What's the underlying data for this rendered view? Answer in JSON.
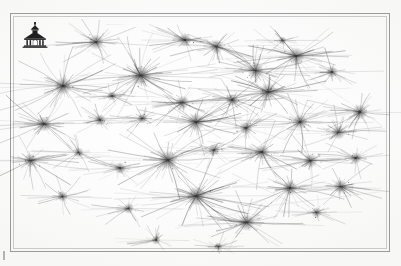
{
  "document": {
    "kind": "scanned-plate",
    "page_background": "#fdfdfd",
    "frame_color": "#9a9a9a",
    "ink_color": "#3a3a3a",
    "label_color": "#767676",
    "frame": {
      "x": 10,
      "y": 13,
      "width": 380,
      "height": 239
    }
  },
  "emblem": {
    "name": "institutional-building-emblem",
    "x": 21,
    "y": 22,
    "width": 28,
    "height": 26,
    "color": "#1f1f1f",
    "caption": ""
  },
  "registration_tick": {
    "x": 3,
    "y": 251,
    "width": 2,
    "height": 9,
    "color": "#b3b3b3"
  },
  "rule_lines": [
    {
      "x": 120,
      "y": 188,
      "length": 150,
      "angle": 11,
      "opacity": 0.55
    },
    {
      "x": 150,
      "y": 200,
      "length": 120,
      "angle": -9,
      "opacity": 0.4
    },
    {
      "x": 232,
      "y": 173,
      "length": 95,
      "angle": 26,
      "opacity": 0.45
    },
    {
      "x": 270,
      "y": 205,
      "length": 110,
      "angle": -7,
      "opacity": 0.4
    },
    {
      "x": 40,
      "y": 150,
      "length": 70,
      "angle": 4,
      "opacity": 0.3
    },
    {
      "x": 300,
      "y": 70,
      "length": 60,
      "angle": 33,
      "opacity": 0.35
    },
    {
      "x": 175,
      "y": 228,
      "length": 80,
      "angle": -14,
      "opacity": 0.35
    }
  ],
  "clusters": [
    {
      "x": 96,
      "y": 42,
      "size": 26,
      "density": 34,
      "reach": 1.15,
      "weight": 0.6,
      "label": "——— –– –– ––",
      "label_dx": 10,
      "label_dy": -18,
      "label_size": 2.4,
      "label_angle": 0
    },
    {
      "x": 63,
      "y": 86,
      "size": 30,
      "density": 42,
      "reach": 1.55,
      "weight": 0.72,
      "label": "–– –– –",
      "label_dx": 13,
      "label_dy": 2,
      "label_size": 2.3,
      "label_angle": 0
    },
    {
      "x": 140,
      "y": 75,
      "size": 34,
      "density": 52,
      "reach": 1.45,
      "weight": 0.85,
      "label": "—— –– ––",
      "label_dx": 15,
      "label_dy": 1,
      "label_size": 2.4,
      "label_angle": 0
    },
    {
      "x": 185,
      "y": 40,
      "size": 22,
      "density": 28,
      "reach": 1.25,
      "weight": 0.5,
      "label": "",
      "label_dx": 0,
      "label_dy": 0,
      "label_size": 2.2,
      "label_angle": 0
    },
    {
      "x": 216,
      "y": 46,
      "size": 24,
      "density": 30,
      "reach": 1.2,
      "weight": 0.55,
      "label": "",
      "label_dx": 0,
      "label_dy": 0,
      "label_size": 2.2,
      "label_angle": 0
    },
    {
      "x": 255,
      "y": 70,
      "size": 28,
      "density": 38,
      "reach": 1.35,
      "weight": 0.66,
      "label": "–– ––– –",
      "label_dx": 12,
      "label_dy": 0,
      "label_size": 2.3,
      "label_angle": 0
    },
    {
      "x": 296,
      "y": 56,
      "size": 30,
      "density": 40,
      "reach": 1.3,
      "weight": 0.7,
      "label": "———— –––",
      "label_dx": -6,
      "label_dy": -11,
      "label_size": 2.4,
      "label_angle": 0
    },
    {
      "x": 332,
      "y": 72,
      "size": 20,
      "density": 24,
      "reach": 1.4,
      "weight": 0.45,
      "label": "",
      "label_dx": 0,
      "label_dy": 0,
      "label_size": 2.2,
      "label_angle": 0
    },
    {
      "x": 360,
      "y": 112,
      "size": 26,
      "density": 34,
      "reach": 1.3,
      "weight": 0.6,
      "label": "–– ––",
      "label_dx": -24,
      "label_dy": 0,
      "label_size": 2.3,
      "label_angle": 0
    },
    {
      "x": 182,
      "y": 102,
      "size": 24,
      "density": 30,
      "reach": 1.25,
      "weight": 0.56,
      "label": "—— –– –",
      "label_dx": -26,
      "label_dy": -6,
      "label_size": 2.3,
      "label_angle": 0
    },
    {
      "x": 232,
      "y": 100,
      "size": 22,
      "density": 26,
      "reach": 1.35,
      "weight": 0.5,
      "label": "––– ––",
      "label_dx": 11,
      "label_dy": 1,
      "label_size": 2.3,
      "label_angle": 0
    },
    {
      "x": 268,
      "y": 92,
      "size": 30,
      "density": 44,
      "reach": 1.3,
      "weight": 0.74,
      "label": "",
      "label_dx": 0,
      "label_dy": 0,
      "label_size": 2.2,
      "label_angle": 0
    },
    {
      "x": 44,
      "y": 124,
      "size": 26,
      "density": 36,
      "reach": 1.45,
      "weight": 0.62,
      "label": "–– –",
      "label_dx": 13,
      "label_dy": 1,
      "label_size": 2.3,
      "label_angle": 0
    },
    {
      "x": 100,
      "y": 120,
      "size": 20,
      "density": 22,
      "reach": 1.2,
      "weight": 0.44,
      "label": "–––",
      "label_dx": 9,
      "label_dy": 2,
      "label_size": 2.2,
      "label_angle": 0
    },
    {
      "x": 142,
      "y": 118,
      "size": 18,
      "density": 20,
      "reach": 1.25,
      "weight": 0.4,
      "label": "",
      "label_dx": 0,
      "label_dy": 0,
      "label_size": 2.2,
      "label_angle": 0
    },
    {
      "x": 196,
      "y": 122,
      "size": 30,
      "density": 46,
      "reach": 1.3,
      "weight": 0.78,
      "label": "—— –– –",
      "label_dx": -28,
      "label_dy": -7,
      "label_size": 2.3,
      "label_angle": 0
    },
    {
      "x": 246,
      "y": 128,
      "size": 22,
      "density": 28,
      "reach": 1.3,
      "weight": 0.52,
      "label": "",
      "label_dx": 0,
      "label_dy": 0,
      "label_size": 2.2,
      "label_angle": 0
    },
    {
      "x": 300,
      "y": 122,
      "size": 26,
      "density": 34,
      "reach": 1.35,
      "weight": 0.6,
      "label": "–– –––",
      "label_dx": 12,
      "label_dy": 0,
      "label_size": 2.3,
      "label_angle": 0
    },
    {
      "x": 338,
      "y": 132,
      "size": 24,
      "density": 30,
      "reach": 1.25,
      "weight": 0.56,
      "label": "",
      "label_dx": 0,
      "label_dy": 0,
      "label_size": 2.2,
      "label_angle": 0
    },
    {
      "x": 30,
      "y": 160,
      "size": 24,
      "density": 30,
      "reach": 1.5,
      "weight": 0.56,
      "label": "–– –",
      "label_dx": 13,
      "label_dy": 1,
      "label_size": 2.3,
      "label_angle": 0
    },
    {
      "x": 78,
      "y": 152,
      "size": 18,
      "density": 20,
      "reach": 1.3,
      "weight": 0.4,
      "label": "",
      "label_dx": 0,
      "label_dy": 0,
      "label_size": 2.2,
      "label_angle": 0
    },
    {
      "x": 120,
      "y": 168,
      "size": 20,
      "density": 24,
      "reach": 1.25,
      "weight": 0.46,
      "label": "––– –",
      "label_dx": 10,
      "label_dy": 2,
      "label_size": 2.2,
      "label_angle": 0
    },
    {
      "x": 168,
      "y": 160,
      "size": 32,
      "density": 50,
      "reach": 1.4,
      "weight": 0.82,
      "label": "——— –– –",
      "label_dx": 16,
      "label_dy": 3,
      "label_size": 2.4,
      "label_angle": 0
    },
    {
      "x": 214,
      "y": 150,
      "size": 20,
      "density": 22,
      "reach": 1.2,
      "weight": 0.44,
      "label": "",
      "label_dx": 0,
      "label_dy": 0,
      "label_size": 2.2,
      "label_angle": 0
    },
    {
      "x": 262,
      "y": 152,
      "size": 26,
      "density": 36,
      "reach": 1.55,
      "weight": 0.62,
      "label": "",
      "label_dx": 0,
      "label_dy": 0,
      "label_size": 2.2,
      "label_angle": 0
    },
    {
      "x": 310,
      "y": 160,
      "size": 24,
      "density": 32,
      "reach": 1.3,
      "weight": 0.58,
      "label": "–– ––",
      "label_dx": 11,
      "label_dy": 0,
      "label_size": 2.3,
      "label_angle": 0
    },
    {
      "x": 356,
      "y": 158,
      "size": 20,
      "density": 24,
      "reach": 1.25,
      "weight": 0.46,
      "label": "–––",
      "label_dx": -20,
      "label_dy": 0,
      "label_size": 2.2,
      "label_angle": 0
    },
    {
      "x": 62,
      "y": 196,
      "size": 18,
      "density": 20,
      "reach": 1.3,
      "weight": 0.4,
      "label": "",
      "label_dx": 0,
      "label_dy": 0,
      "label_size": 2.2,
      "label_angle": 0
    },
    {
      "x": 128,
      "y": 208,
      "size": 18,
      "density": 20,
      "reach": 1.45,
      "weight": 0.4,
      "label": "—— –– –",
      "label_dx": 11,
      "label_dy": 1,
      "label_size": 2.3,
      "label_angle": 0
    },
    {
      "x": 196,
      "y": 196,
      "size": 32,
      "density": 50,
      "reach": 1.35,
      "weight": 0.82,
      "label": "",
      "label_dx": 0,
      "label_dy": 0,
      "label_size": 2.2,
      "label_angle": 0
    },
    {
      "x": 246,
      "y": 222,
      "size": 28,
      "density": 40,
      "reach": 1.3,
      "weight": 0.7,
      "label": "––– ––",
      "label_dx": -10,
      "label_dy": 10,
      "label_size": 2.3,
      "label_angle": 0
    },
    {
      "x": 290,
      "y": 188,
      "size": 26,
      "density": 34,
      "reach": 1.4,
      "weight": 0.62,
      "label": "",
      "label_dx": 0,
      "label_dy": 0,
      "label_size": 2.2,
      "label_angle": 0
    },
    {
      "x": 340,
      "y": 186,
      "size": 24,
      "density": 32,
      "reach": 1.3,
      "weight": 0.58,
      "label": "––– ––",
      "label_dx": -26,
      "label_dy": 0,
      "label_size": 2.3,
      "label_angle": 0
    },
    {
      "x": 316,
      "y": 212,
      "size": 18,
      "density": 20,
      "reach": 1.25,
      "weight": 0.4,
      "label": "",
      "label_dx": 0,
      "label_dy": 0,
      "label_size": 2.2,
      "label_angle": 0
    },
    {
      "x": 156,
      "y": 240,
      "size": 16,
      "density": 18,
      "reach": 1.25,
      "weight": 0.36,
      "label": "–– –",
      "label_dx": 9,
      "label_dy": 1,
      "label_size": 2.2,
      "label_angle": 0
    },
    {
      "x": 218,
      "y": 246,
      "size": 14,
      "density": 16,
      "reach": 1.2,
      "weight": 0.32,
      "label": "",
      "label_dx": 0,
      "label_dy": 0,
      "label_size": 2.2,
      "label_angle": 0
    },
    {
      "x": 112,
      "y": 96,
      "size": 16,
      "density": 18,
      "reach": 1.3,
      "weight": 0.36,
      "label": "",
      "label_dx": 0,
      "label_dy": 0,
      "label_size": 2.2,
      "label_angle": 0
    },
    {
      "x": 282,
      "y": 40,
      "size": 14,
      "density": 16,
      "reach": 1.4,
      "weight": 0.32,
      "label": "",
      "label_dx": 0,
      "label_dy": 0,
      "label_size": 2.2,
      "label_angle": 0
    }
  ]
}
